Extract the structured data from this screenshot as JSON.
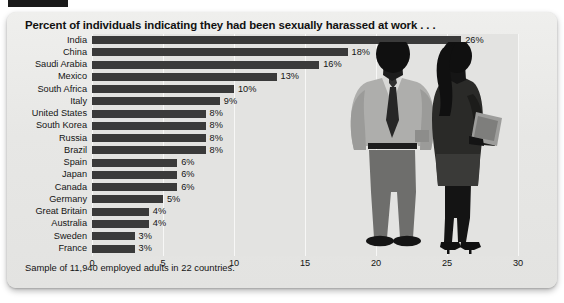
{
  "chart_data": {
    "type": "bar",
    "orientation": "horizontal",
    "title": "Percent of individuals indicating they had been sexually harassed at work . . .",
    "footnote": "Sample of 11,940 employed adults in 22 countries.",
    "xlabel": "",
    "ylabel": "",
    "xlim": [
      0,
      30
    ],
    "grid": true,
    "gridlines": [
      0,
      5,
      10,
      15,
      20,
      25,
      30
    ],
    "xticks": [
      "0",
      "5",
      "10",
      "15",
      "20",
      "25",
      "30"
    ],
    "value_suffix": "%",
    "categories": [
      "India",
      "China",
      "Saudi Arabia",
      "Mexico",
      "South Africa",
      "Italy",
      "United States",
      "South Korea",
      "Russia",
      "Brazil",
      "Spain",
      "Japan",
      "Canada",
      "Germany",
      "Great Britain",
      "Australia",
      "Sweden",
      "France"
    ],
    "values": [
      26,
      18,
      16,
      13,
      10,
      9,
      8,
      8,
      8,
      8,
      6,
      6,
      6,
      5,
      4,
      4,
      3,
      3
    ],
    "data_labels": [
      "26%",
      "18%",
      "16%",
      "13%",
      "10%",
      "9%",
      "8%",
      "8%",
      "8%",
      "8%",
      "6%",
      "6%",
      "6%",
      "5%",
      "4%",
      "4%",
      "3%",
      "3%"
    ],
    "colors": {
      "bar": "#3a3a3a",
      "plot_background": "#e3e3e1",
      "panel_background": "#e9e9e7",
      "gridline": "#f7f7f6",
      "text": "#141414",
      "figure_suit": "#a9a9a7",
      "figure_dark": "#1c1c1c",
      "figure_mid": "#6d6d6b"
    }
  },
  "illustration": {
    "man_label": "businessman-silhouette",
    "woman_label": "businesswoman-silhouette",
    "woman_prop": "tablet"
  }
}
